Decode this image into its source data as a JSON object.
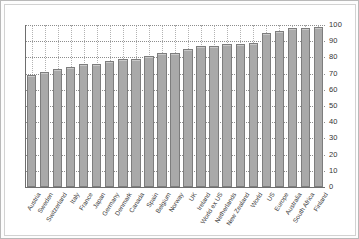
{
  "chart_data": {
    "type": "bar",
    "title": "",
    "xlabel": "",
    "ylabel": "",
    "ylim": [
      0,
      100
    ],
    "yticks": [
      0,
      10,
      20,
      30,
      40,
      50,
      60,
      70,
      80,
      90,
      100
    ],
    "grid": true,
    "legend": "none",
    "bar_color": "#a9a9a9",
    "bar_border_color": "#7d7d7d",
    "gridline_color": "#8d8d8d",
    "axis_color": "#6e6e6e",
    "categories": [
      "Austria",
      "Sweden",
      "Switzerland",
      "Italy",
      "France",
      "Japan",
      "Germany",
      "Denmark",
      "Canada",
      "Spain",
      "Belgium",
      "Norway",
      "UK",
      "Ireland",
      "World ex US",
      "Netherlands",
      "New Zealand",
      "World",
      "US",
      "Europe",
      "Australia",
      "South Africa",
      "Finland"
    ],
    "values": [
      69,
      71,
      73,
      74,
      76,
      76,
      78,
      79,
      79,
      81,
      83,
      83,
      85,
      87,
      87,
      88,
      88,
      89,
      95,
      96,
      98,
      98,
      99
    ]
  }
}
